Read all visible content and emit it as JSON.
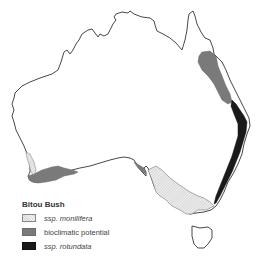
{
  "map": {
    "region": "Australia",
    "legend": {
      "title": "Bitou Bush",
      "items": [
        {
          "label": "ssp. monilifera",
          "style": "hatched",
          "color": "#e0e0e0"
        },
        {
          "label": "bioclimatic potential",
          "style": "solid",
          "color": "#7a7a7a"
        },
        {
          "label": "ssp. rotundata",
          "style": "solid",
          "color": "#1a1a1a"
        }
      ]
    }
  }
}
